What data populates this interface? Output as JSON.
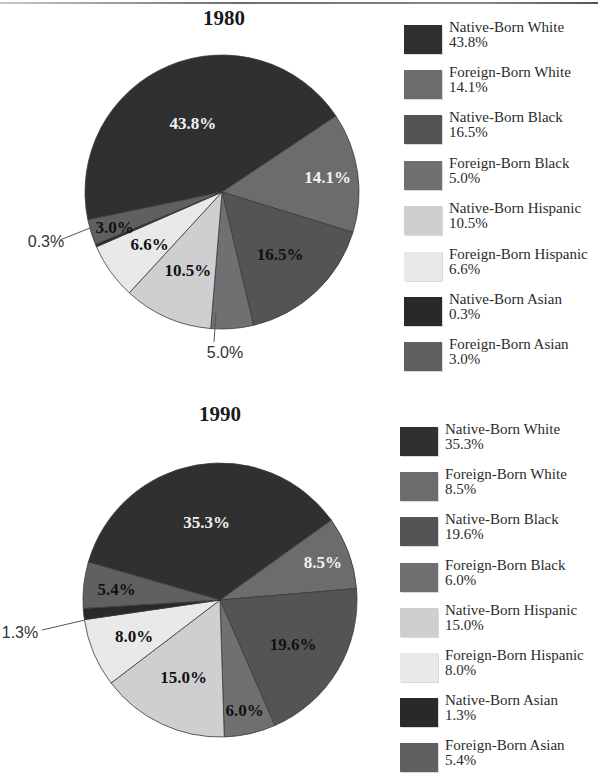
{
  "colors": {
    "native_born_white": "#303031",
    "foreign_born_white": "#6c6c6e",
    "native_born_black": "#545456",
    "foreign_born_black": "#707072",
    "native_born_hispanic": "#cfcfd1",
    "foreign_born_hispanic": "#e9e9ea",
    "native_born_asian": "#29292a",
    "foreign_born_asian": "#606062"
  },
  "chart_data": [
    {
      "type": "pie",
      "title": "1980",
      "categories": [
        "Native-Born White",
        "Foreign-Born White",
        "Native-Born Black",
        "Foreign-Born Black",
        "Native-Born Hispanic",
        "Foreign-Born Hispanic",
        "Native-Born Asian",
        "Foreign-Born Asian"
      ],
      "values": [
        43.8,
        14.1,
        16.5,
        5.0,
        10.5,
        6.6,
        0.3,
        3.0
      ],
      "labels": [
        "43.8%",
        "14.1%",
        "16.5%",
        "5.0%",
        "10.5%",
        "6.6%",
        "0.3%",
        "3.0%"
      ],
      "legend_position": "right"
    },
    {
      "type": "pie",
      "title": "1990",
      "categories": [
        "Native-Born White",
        "Foreign-Born White",
        "Native-Born Black",
        "Foreign-Born Black",
        "Native-Born Hispanic",
        "Foreign-Born Hispanic",
        "Native-Born Asian",
        "Foreign-Born Asian"
      ],
      "values": [
        35.3,
        8.5,
        19.6,
        6.0,
        15.0,
        8.0,
        1.3,
        5.4
      ],
      "labels": [
        "35.3%",
        "8.5%",
        "19.6%",
        "6.0%",
        "15.0%",
        "8.0%",
        "1.3%",
        "5.4%"
      ],
      "legend_position": "right"
    }
  ],
  "charts": [
    {
      "title": "1980",
      "legend": [
        {
          "name": "Native-Born White",
          "value": "43.8%"
        },
        {
          "name": "Foreign-Born White",
          "value": "14.1%"
        },
        {
          "name": "Native-Born Black",
          "value": "16.5%"
        },
        {
          "name": "Foreign-Born Black",
          "value": "5.0%"
        },
        {
          "name": "Native-Born Hispanic",
          "value": "10.5%"
        },
        {
          "name": "Foreign-Born Hispanic",
          "value": "6.6%"
        },
        {
          "name": "Native-Born Asian",
          "value": "0.3%"
        },
        {
          "name": "Foreign-Born Asian",
          "value": "3.0%"
        }
      ]
    },
    {
      "title": "1990",
      "legend": [
        {
          "name": "Native-Born White",
          "value": "35.3%"
        },
        {
          "name": "Foreign-Born White",
          "value": "8.5%"
        },
        {
          "name": "Native-Born Black",
          "value": "19.6%"
        },
        {
          "name": "Foreign-Born Black",
          "value": "6.0%"
        },
        {
          "name": "Native-Born Hispanic",
          "value": "15.0%"
        },
        {
          "name": "Foreign-Born Hispanic",
          "value": "8.0%"
        },
        {
          "name": "Native-Born Asian",
          "value": "1.3%"
        },
        {
          "name": "Foreign-Born Asian",
          "value": "5.4%"
        }
      ]
    }
  ]
}
